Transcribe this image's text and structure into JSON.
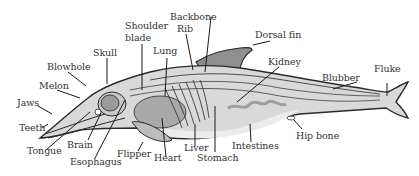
{
  "diagram": {
    "colors": {
      "outline": "#2a2a2a",
      "body_fill": "#d9d9d9",
      "dorsal_fill": "#8f8f8f",
      "organ_fill": "#a9a9a9",
      "belly_fill": "#ececec",
      "label_text": "#333333"
    },
    "labels": {
      "backbone": "Backbone",
      "rib": "Rib",
      "shoulder_blade_line1": "Shoulder",
      "shoulder_blade_line2": "blade",
      "lung": "Lung",
      "skull": "Skull",
      "blowhole": "Blowhole",
      "melon": "Melon",
      "jaws": "Jaws",
      "teeth": "Teeth",
      "tongue": "Tongue",
      "brain": "Brain",
      "esophagus": "Esophagus",
      "flipper": "Flipper",
      "heart": "Heart",
      "liver": "Liver",
      "stomach": "Stomach",
      "intestines": "Intestines",
      "hip_bone": "Hip bone",
      "dorsal_fin": "Dorsal fin",
      "kidney": "Kidney",
      "blubber": "Blubber",
      "fluke": "Fluke"
    }
  }
}
